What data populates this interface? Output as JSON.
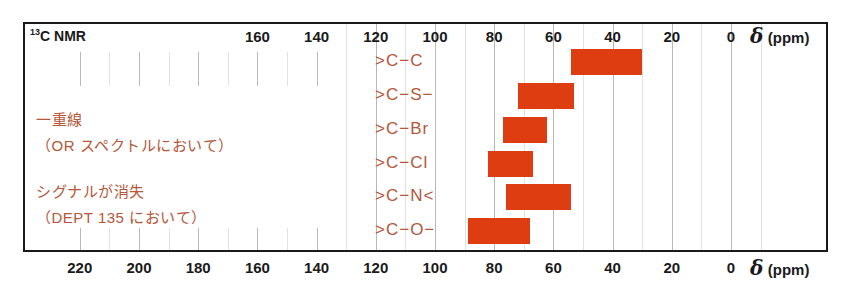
{
  "chart_data": {
    "type": "bar",
    "orientation": "horizontal-range",
    "title": "13C NMR",
    "title_parts": {
      "superscript": "13",
      "text": "C NMR"
    },
    "xlabel": "δ (ppm)",
    "xlabel_parts": {
      "symbol": "δ",
      "unit": "(ppm)"
    },
    "xlim": [
      230,
      -10
    ],
    "x_reversed": true,
    "x_ticks_top": [
      160,
      140,
      120,
      100,
      80,
      60,
      40,
      20,
      0
    ],
    "x_ticks_bottom": [
      220,
      200,
      180,
      160,
      140,
      120,
      100,
      80,
      60,
      40,
      20,
      0
    ],
    "grid": true,
    "bar_color": "#dd3d10",
    "label_color": "#b5573a",
    "categories": [
      ">C−C",
      ">C−S−",
      ">C−Br",
      ">C−Cl",
      ">C−N<",
      ">C−O−"
    ],
    "series": [
      {
        "name": "chemical shift range",
        "ranges": [
          {
            "label": ">C−C",
            "from": 54,
            "to": 30
          },
          {
            "label": ">C−S−",
            "from": 72,
            "to": 53
          },
          {
            "label": ">C−Br",
            "from": 77,
            "to": 62
          },
          {
            "label": ">C−Cl",
            "from": 82,
            "to": 67
          },
          {
            "label": ">C−N<",
            "from": 76,
            "to": 54
          },
          {
            "label": ">C−O−",
            "from": 89,
            "to": 68
          }
        ]
      }
    ],
    "annotations": [
      {
        "line1": "一重線",
        "line2": "（OR スペクトルにおいて）"
      },
      {
        "line1": "シグナルが消失",
        "line2": "（DEPT 135 において）"
      }
    ]
  }
}
